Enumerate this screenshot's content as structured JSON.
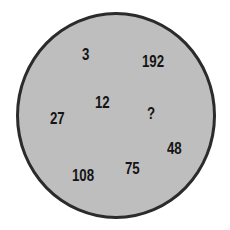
{
  "puzzle": {
    "shape": "circle",
    "fill_color": "#bebebe",
    "border_color": "#2b2b2b",
    "numbers": [
      {
        "id": "n3",
        "value": "3"
      },
      {
        "id": "n192",
        "value": "192"
      },
      {
        "id": "n12",
        "value": "12"
      },
      {
        "id": "n27",
        "value": "27"
      },
      {
        "id": "nq",
        "value": "?"
      },
      {
        "id": "n48",
        "value": "48"
      },
      {
        "id": "n75",
        "value": "75"
      },
      {
        "id": "n108",
        "value": "108"
      }
    ]
  }
}
